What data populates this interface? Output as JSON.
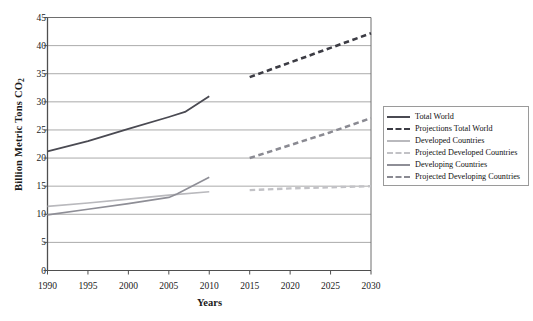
{
  "chart_data": {
    "type": "line",
    "title": "",
    "xlabel": "Years",
    "ylabel": "Billion Metric Tons CO2",
    "ylabel_text": "Billion Metric Tons CO",
    "ylabel_sub": "2",
    "xlim": [
      1990,
      2030
    ],
    "ylim": [
      0,
      45
    ],
    "ytick_step": 5,
    "xtick_step": 5,
    "grid": "horizontal",
    "legend_position": "right",
    "xticks": [
      "1990",
      "1995",
      "2000",
      "2005",
      "2010",
      "2015",
      "2020",
      "2025",
      "2030"
    ],
    "yticks": [
      "0",
      "5",
      "10",
      "15",
      "20",
      "25",
      "30",
      "35",
      "40",
      "45"
    ],
    "series": [
      {
        "name": "Total World",
        "style": "solid",
        "color": "#4a4a52",
        "width": 1.8,
        "x": [
          1990,
          1995,
          2000,
          2005,
          2007,
          2010
        ],
        "values": [
          21.2,
          23.0,
          25.2,
          27.3,
          28.2,
          31.0
        ]
      },
      {
        "name": "Projections Total World",
        "style": "dashed",
        "color": "#3c3c44",
        "width": 2.6,
        "x": [
          2015,
          2020,
          2025,
          2030
        ],
        "values": [
          34.4,
          37.0,
          39.6,
          42.2
        ]
      },
      {
        "name": "Developed Countries",
        "style": "solid",
        "color": "#b9b9bd",
        "width": 1.6,
        "x": [
          1990,
          1995,
          2000,
          2005,
          2010
        ],
        "values": [
          11.4,
          12.0,
          12.7,
          13.4,
          14.0
        ]
      },
      {
        "name": "Projected Developed Countries",
        "style": "dashed",
        "color": "#c2c2c6",
        "width": 2.4,
        "x": [
          2015,
          2020,
          2025,
          2030
        ],
        "values": [
          14.3,
          14.6,
          14.8,
          15.0
        ]
      },
      {
        "name": "Developing Countries",
        "style": "solid",
        "color": "#8e8e96",
        "width": 1.6,
        "x": [
          1990,
          1995,
          2000,
          2005,
          2006,
          2010
        ],
        "values": [
          9.9,
          10.9,
          11.9,
          13.0,
          13.6,
          16.6
        ]
      },
      {
        "name": "Projected Developing Countries",
        "style": "dashed",
        "color": "#8a8a92",
        "width": 2.5,
        "x": [
          2015,
          2020,
          2025,
          2030
        ],
        "values": [
          20.0,
          22.3,
          24.6,
          27.1
        ]
      }
    ]
  },
  "legend": {
    "entries": [
      {
        "label": "Total World"
      },
      {
        "label": "Projections Total World"
      },
      {
        "label": "Developed Countries"
      },
      {
        "label": "Projected Developed Countries"
      },
      {
        "label": "Developing Countries"
      },
      {
        "label": "Projected Developing Countries"
      }
    ]
  },
  "colors": {
    "grid": "#a0a0a0",
    "axis": "#6e6e6e",
    "background": "#ffffff",
    "text": "#1a1a1a"
  }
}
